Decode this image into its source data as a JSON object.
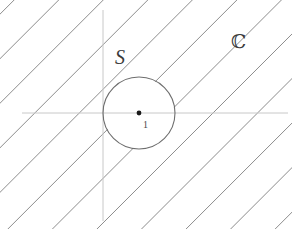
{
  "figure": {
    "kind": "math-diagram",
    "width": 292,
    "height": 229,
    "background_color": "#ffffff"
  },
  "labels": {
    "set_label": "S",
    "plane_label": "ℂ",
    "center_label": "1"
  },
  "label_positions": {
    "set_label": {
      "x": 115,
      "y": 64
    },
    "plane_label": {
      "x": 231,
      "y": 48
    },
    "center_label": {
      "x": 143,
      "y": 128
    }
  },
  "colors": {
    "hatch": "#8c8c8c",
    "axis": "#c8c8c8",
    "circle": "#6e6e6e",
    "point": "#1a1a1a",
    "label": "#3a3a3a"
  },
  "axes": {
    "horizontal": {
      "x1": 22,
      "y1": 113,
      "x2": 288,
      "y2": 113
    },
    "vertical": {
      "x1": 103,
      "y1": 10,
      "x2": 103,
      "y2": 221
    },
    "origin": {
      "x": 103,
      "y": 113
    }
  },
  "circle": {
    "center": {
      "x": 139,
      "y": 113
    },
    "radius": 36,
    "stroke_width": 1.1
  },
  "center_point": {
    "x": 139,
    "y": 113,
    "radius": 2.4,
    "value": "1"
  },
  "hatching": {
    "angle_degrees": -45,
    "spacing": 31.5,
    "stroke_width": 1.0,
    "count": 17,
    "region": "exterior of circle"
  },
  "chart_data": {
    "type": "scatter",
    "title": "",
    "xlabel": "",
    "ylabel": "",
    "points": [
      {
        "label": "1",
        "x": 1,
        "y": 0
      }
    ],
    "shapes": [
      {
        "kind": "circle",
        "label": "S",
        "center_x": 1,
        "center_y": 0,
        "radius": 1,
        "filled": false
      },
      {
        "kind": "hatched-region",
        "label": "ℂ",
        "description": "complement of the open disc S"
      }
    ]
  }
}
